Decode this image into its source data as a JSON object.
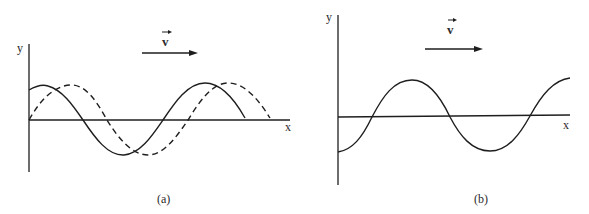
{
  "panels": [
    {
      "id": "a",
      "caption": "(a)",
      "y_axis_label": "y",
      "x_axis_label": "x",
      "velocity_label": "v",
      "velocity_direction": "right",
      "curves": [
        {
          "name": "wave at time t",
          "style": "solid"
        },
        {
          "name": "wave at later time (shifted right)",
          "style": "dashed"
        }
      ]
    },
    {
      "id": "b",
      "caption": "(b)",
      "y_axis_label": "y",
      "x_axis_label": "x",
      "velocity_label": "v",
      "velocity_direction": "right",
      "curves": [
        {
          "name": "wave",
          "style": "solid"
        }
      ]
    }
  ],
  "colors": {
    "ink": "#1e1e1e",
    "background": "#ffffff"
  }
}
